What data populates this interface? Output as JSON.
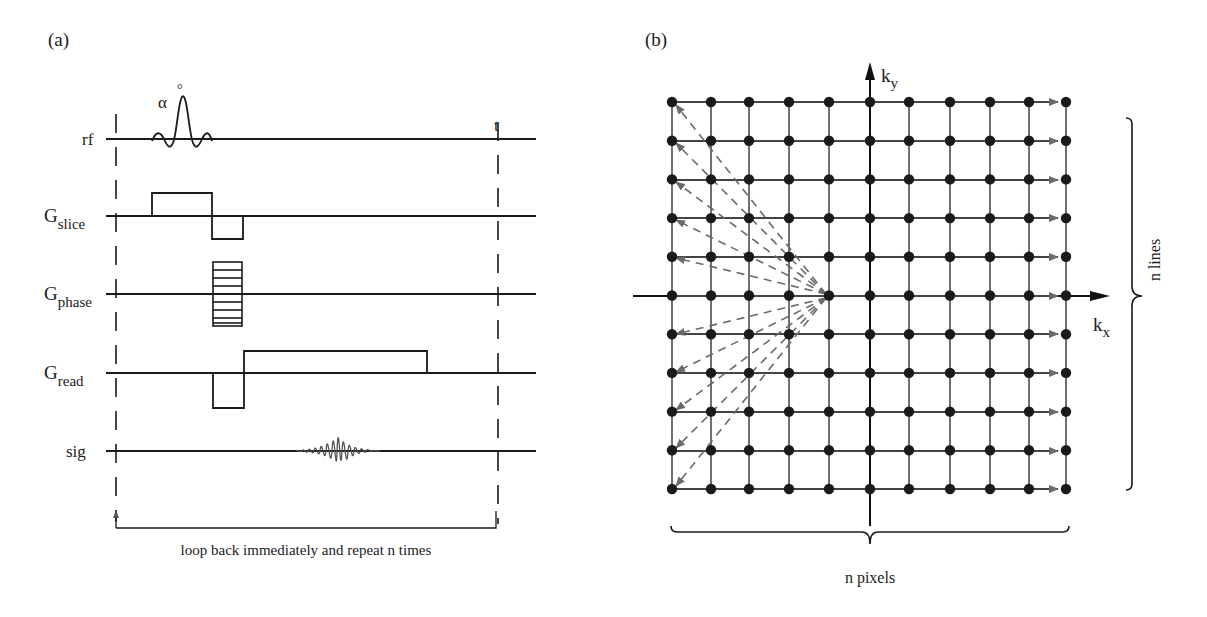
{
  "panel_a": {
    "label": "(a)",
    "time_axis_label": "t",
    "flip_angle_label": "α",
    "flip_angle_unit": "°",
    "channels": [
      {
        "id": "rf",
        "name": "rf",
        "sub": ""
      },
      {
        "id": "g_slice",
        "name": "G",
        "sub": "slice"
      },
      {
        "id": "g_phase",
        "name": "G",
        "sub": "phase"
      },
      {
        "id": "g_read",
        "name": "G",
        "sub": "read"
      },
      {
        "id": "sig",
        "name": "sig",
        "sub": ""
      }
    ],
    "loop_caption": "loop back immediately and repeat n times"
  },
  "panel_b": {
    "label": "(b)",
    "ky_label": "k",
    "ky_sub": "y",
    "kx_label": "k",
    "kx_sub": "x",
    "grid_columns": 11,
    "grid_rows": 11,
    "vertical_brace_label": "n lines",
    "horizontal_brace_label": "n pixels"
  },
  "colors": {
    "ink": "#1a1a1a",
    "grid_line": "#333333",
    "trajectory_arrow": "#666666",
    "dashed_return": "#6a6a6a",
    "background": "#ffffff"
  }
}
